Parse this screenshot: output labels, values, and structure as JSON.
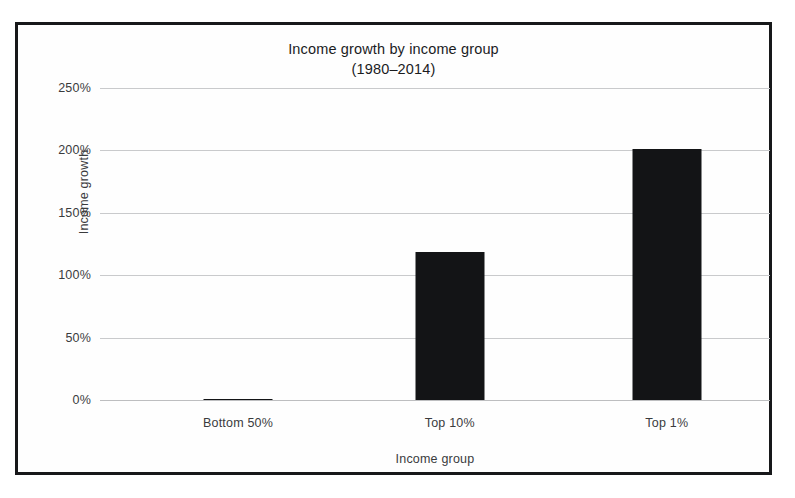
{
  "chart_data": {
    "type": "bar",
    "title": "Income growth by income group",
    "subtitle": "(1980–2014)",
    "categories": [
      "Bottom 50%",
      "Top 10%",
      "Top 1%"
    ],
    "values": [
      1,
      119,
      201
    ],
    "xlabel": "Income group",
    "ylabel": "Income growth",
    "ylim": [
      0,
      250
    ],
    "ytick_labels": [
      "0%",
      "50%",
      "100%",
      "150%",
      "200%",
      "250%"
    ],
    "ytick_values": [
      0,
      50,
      100,
      150,
      200,
      250
    ],
    "grid": true,
    "legend": null,
    "series": [
      {
        "name": "Income growth",
        "values": [
          1,
          119,
          201
        ]
      }
    ],
    "colors": {
      "bar": "#131416",
      "grid": "#c9cacc",
      "text": "#3a3b3d",
      "title": "#1b1c1e",
      "frame": "#17181a",
      "background": "#fefefe"
    }
  }
}
